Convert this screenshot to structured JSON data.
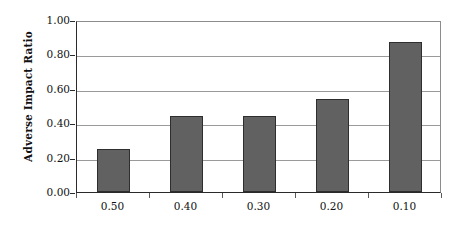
{
  "chart_data": {
    "type": "bar",
    "title": "",
    "xlabel": "",
    "ylabel": "Adverse Impact Ratio",
    "categories": [
      "0.50",
      "0.40",
      "0.30",
      "0.20",
      "0.10"
    ],
    "values": [
      0.25,
      0.44,
      0.44,
      0.54,
      0.87
    ],
    "ylim": [
      0.0,
      1.0
    ],
    "ytick_labels": [
      "0.00",
      "0.20",
      "0.40",
      "0.60",
      "0.80",
      "1.00"
    ],
    "ytick_values": [
      0.0,
      0.2,
      0.4,
      0.6,
      0.8,
      1.0
    ],
    "grid": true,
    "legend": "none",
    "series": [
      {
        "name": "Adverse Impact Ratio",
        "values": [
          0.25,
          0.44,
          0.44,
          0.54,
          0.87
        ],
        "color": "#616161"
      }
    ]
  },
  "colors": {
    "bar_fill": "#616161",
    "bar_border": "#2e2e2e",
    "gridline": "#9a9a9a",
    "axis": "#2b2b2b",
    "background": "#ffffff",
    "text": "#111111"
  }
}
